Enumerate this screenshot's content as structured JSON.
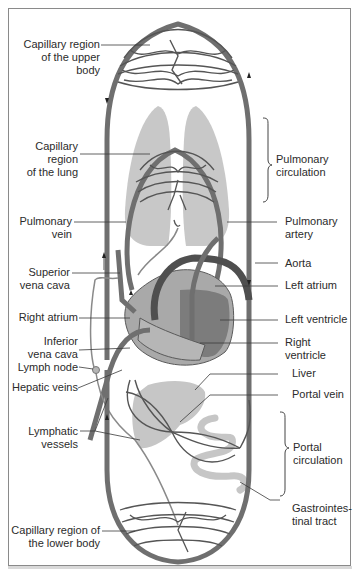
{
  "figure": {
    "colors": {
      "vessel": "#6f6f6f",
      "vessel_dark": "#4f4f4f",
      "organ_fill": "#c4c4c4",
      "heart_light": "#a9a9a9",
      "heart_dark": "#7a7a7a",
      "leader_line": "#3a3a3a",
      "frame": "#8a8a8a"
    }
  },
  "labels_left": [
    {
      "id": "capillary-upper-body",
      "text": "Capillary region\nof the upper body"
    },
    {
      "id": "capillary-lung",
      "text": "Capillary\nregion\nof the lung"
    },
    {
      "id": "pulmonary-vein",
      "text": "Pulmonary\nvein"
    },
    {
      "id": "superior-vena-cava",
      "text": "Superior\nvena cava"
    },
    {
      "id": "right-atrium",
      "text": "Right atrium"
    },
    {
      "id": "inferior-vena-cava",
      "text": "Inferior\nvena cava"
    },
    {
      "id": "lymph-node",
      "text": "Lymph node"
    },
    {
      "id": "hepatic-veins",
      "text": "Hepatic veins"
    },
    {
      "id": "lymphatic-vessels",
      "text": "Lymphatic\nvessels"
    },
    {
      "id": "capillary-lower-body",
      "text": "Capillary region of\nthe lower body"
    }
  ],
  "labels_right": [
    {
      "id": "pulmonary-circulation",
      "text": "Pulmonary\ncirculation"
    },
    {
      "id": "pulmonary-artery",
      "text": "Pulmonary\nartery"
    },
    {
      "id": "aorta",
      "text": "Aorta"
    },
    {
      "id": "left-atrium",
      "text": "Left atrium"
    },
    {
      "id": "left-ventricle",
      "text": "Left ventricle"
    },
    {
      "id": "right-ventricle",
      "text": "Right ventricle"
    },
    {
      "id": "liver",
      "text": "Liver"
    },
    {
      "id": "portal-vein",
      "text": "Portal vein"
    },
    {
      "id": "portal-circulation",
      "text": "Portal\ncirculation"
    },
    {
      "id": "gastrointestinal-tract",
      "text": "Gastrointes-\ntinal tract"
    }
  ]
}
